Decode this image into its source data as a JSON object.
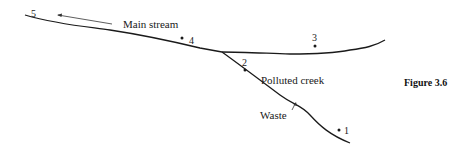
{
  "figure": {
    "caption": "Figure 3.6"
  },
  "labels": {
    "main_stream": "Main stream",
    "polluted_creek": "Polluted creek",
    "waste": "Waste"
  },
  "stations": [
    {
      "id": "1",
      "label": "1"
    },
    {
      "id": "2",
      "label": "2"
    },
    {
      "id": "3",
      "label": "3"
    },
    {
      "id": "4",
      "label": "4"
    },
    {
      "id": "5",
      "label": "5"
    }
  ],
  "colors": {
    "line": "#1a1a1a",
    "arrow": "#333333"
  }
}
